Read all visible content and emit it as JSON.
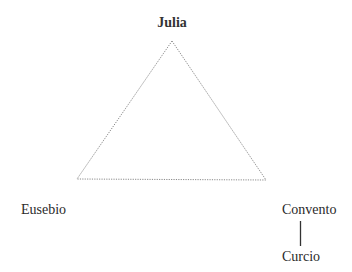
{
  "diagram": {
    "type": "relationship-triangle",
    "nodes": {
      "julia": {
        "label": "Julia"
      },
      "eusebio": {
        "label": "Eusebio"
      },
      "convento": {
        "label": "Convento"
      },
      "curcio": {
        "label": "Curcio"
      }
    },
    "edges": [
      {
        "from": "Julia",
        "to": "Eusebio",
        "style": "dotted"
      },
      {
        "from": "Julia",
        "to": "Convento",
        "style": "dotted"
      },
      {
        "from": "Eusebio",
        "to": "Convento",
        "style": "dotted"
      },
      {
        "from": "Convento",
        "to": "Curcio",
        "style": "solid"
      }
    ],
    "colors": {
      "text": "#2a2a2a",
      "triangle_line": "#8a8a8a",
      "connector_line": "#333333"
    }
  }
}
